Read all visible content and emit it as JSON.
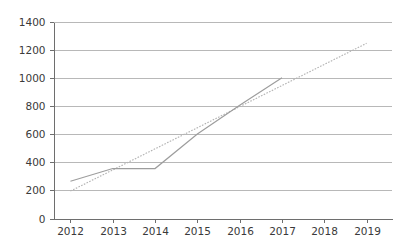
{
  "chart_data": {
    "type": "line",
    "title": "",
    "subtitle": "",
    "xlabel": "",
    "ylabel": "",
    "categories": [
      "2012",
      "2013",
      "2014",
      "2015",
      "2016",
      "2017",
      "2018",
      "2019"
    ],
    "x": [
      2012,
      2013,
      2014,
      2015,
      2016,
      2017,
      2018,
      2019
    ],
    "xlim": [
      2011.6,
      2019.6
    ],
    "ylim": [
      0,
      1400
    ],
    "y_ticks": [
      0,
      200,
      400,
      600,
      800,
      1000,
      1200,
      1400
    ],
    "y_tick_labels": [
      "0",
      "200",
      "400",
      "600",
      "800",
      "1000",
      "1200",
      "1400"
    ],
    "x_tick_labels": [
      "2012",
      "2013",
      "2014",
      "2015",
      "2016",
      "2017",
      "2018",
      "2019"
    ],
    "grid": true,
    "grid_axis": "y",
    "legend": false,
    "legend_position": "none",
    "series": [
      {
        "name": "data",
        "style": "solid",
        "color": "#9d9d9d",
        "x": [
          2012,
          2013,
          2014,
          2015,
          2016,
          2017
        ],
        "values": [
          265,
          355,
          355,
          600,
          805,
          1000
        ]
      },
      {
        "name": "trendline",
        "style": "dotted",
        "color": "#b4b4b4",
        "x": [
          2012,
          2019
        ],
        "values": [
          195,
          1245
        ]
      }
    ],
    "annotations": []
  },
  "colors": {
    "background": "#ffffff",
    "gridline": "#9a9a9a",
    "axis": "#6e6e6e",
    "series_line": "#9d9d9d",
    "trend_line": "#b4b4b4",
    "tick_text": "#3a3a3a"
  }
}
